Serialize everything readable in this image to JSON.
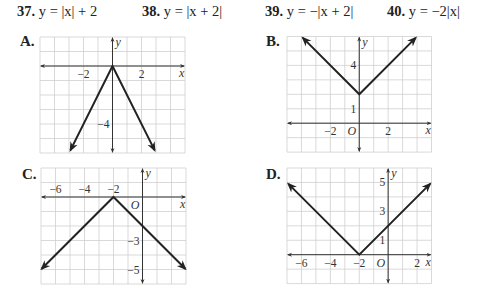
{
  "problems": [
    {
      "number": "37.",
      "equation": "y = |x| + 2",
      "left": 17
    },
    {
      "number": "38.",
      "equation": "y = |x + 2|",
      "left": 142
    },
    {
      "number": "39.",
      "equation": "y = −|x + 2|",
      "left": 265
    },
    {
      "number": "40.",
      "equation": "y = −2|x|",
      "left": 387
    }
  ],
  "colors": {
    "grid": "#cfcfcf",
    "axis": "#333333",
    "graph_line": "#222222",
    "text": "#222222"
  },
  "chart_data": [
    {
      "type": "line",
      "label": "A.",
      "title": "A.",
      "function": "y = -2|x|",
      "xlabel": "x",
      "ylabel": "y",
      "xlim": [
        -5,
        5
      ],
      "ylim": [
        -6,
        2
      ],
      "grid": true,
      "x_tick_labels": [
        {
          "value": -2,
          "text": "−2"
        },
        {
          "value": 2,
          "text": "2"
        }
      ],
      "y_tick_labels": [
        {
          "value": -4,
          "text": "−4"
        }
      ],
      "show_origin_label": false,
      "points": [
        [
          -2.9,
          -5.8
        ],
        [
          0,
          0
        ],
        [
          2.9,
          -5.8
        ]
      ],
      "layout": {
        "x0": 40,
        "y0": 37,
        "cell": 14.5,
        "label_x": 20,
        "label_y": 33
      }
    },
    {
      "type": "line",
      "label": "B.",
      "title": "B.",
      "function": "y = |x| + 2",
      "xlabel": "x",
      "ylabel": "y",
      "xlim": [
        -5,
        5
      ],
      "ylim": [
        -2,
        6
      ],
      "grid": true,
      "x_tick_labels": [
        {
          "value": -2,
          "text": "−2"
        },
        {
          "value": 2,
          "text": "2"
        }
      ],
      "y_tick_labels": [
        {
          "value": 4,
          "text": "4"
        },
        {
          "value": 1,
          "text": "1"
        }
      ],
      "show_origin_label": true,
      "origin_label": "O",
      "points": [
        [
          -3.9,
          5.9
        ],
        [
          0,
          2
        ],
        [
          3.9,
          5.9
        ]
      ],
      "layout": {
        "x0": 287,
        "y0": 36.5,
        "cell": 14.45,
        "label_x": 266,
        "label_y": 33
      }
    },
    {
      "type": "line",
      "label": "C.",
      "title": "C.",
      "function": "y = -|x + 2|",
      "xlabel": "x",
      "ylabel": "y",
      "xlim": [
        -7,
        3
      ],
      "ylim": [
        -6,
        2
      ],
      "grid": true,
      "x_tick_labels": [
        {
          "value": -6,
          "text": "−6"
        },
        {
          "value": -4,
          "text": "−4"
        },
        {
          "value": -2,
          "text": "−2"
        }
      ],
      "y_tick_labels": [
        {
          "value": -3,
          "text": "−3"
        },
        {
          "value": -5,
          "text": "−5"
        }
      ],
      "show_origin_label": true,
      "origin_label": "O",
      "points": [
        [
          -6.95,
          -4.95
        ],
        [
          -2,
          0
        ],
        [
          2.95,
          -4.95
        ]
      ],
      "layout": {
        "x0": 41,
        "y0": 168,
        "cell": 14.5,
        "label_x": 22,
        "label_y": 167
      }
    },
    {
      "type": "line",
      "label": "D.",
      "title": "D.",
      "function": "y = |x + 2|",
      "xlabel": "x",
      "ylabel": "y",
      "xlim": [
        -7,
        3
      ],
      "ylim": [
        -2,
        6
      ],
      "grid": true,
      "x_tick_labels": [
        {
          "value": -6,
          "text": "−6"
        },
        {
          "value": -4,
          "text": "−4"
        },
        {
          "value": -2,
          "text": "−2"
        },
        {
          "value": 2,
          "text": "2"
        }
      ],
      "y_tick_labels": [
        {
          "value": 5,
          "text": "5"
        },
        {
          "value": 3,
          "text": "3"
        },
        {
          "value": 1,
          "text": "1"
        }
      ],
      "show_origin_label": true,
      "origin_label": "O",
      "points": [
        [
          -6.9,
          4.9
        ],
        [
          -2,
          0
        ],
        [
          2.9,
          4.9
        ]
      ],
      "layout": {
        "x0": 287,
        "y0": 168,
        "cell": 14.45,
        "label_x": 266,
        "label_y": 167
      }
    }
  ]
}
